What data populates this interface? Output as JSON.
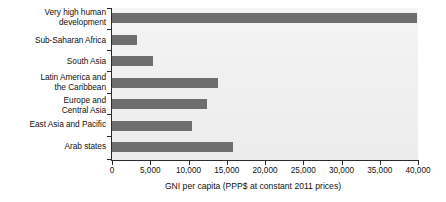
{
  "chart_data": {
    "type": "bar",
    "orientation": "horizontal",
    "title": "",
    "subtitle": "",
    "xlabel": "GNI per capita (PPP$ at constant 2011 prices)",
    "ylabel": "",
    "xlim": [
      0,
      40000
    ],
    "ylim": null,
    "grid": false,
    "legend": null,
    "legend_position": "none",
    "xticks": [
      0,
      5000,
      10000,
      15000,
      20000,
      25000,
      30000,
      35000,
      40000
    ],
    "xtick_labels": [
      "0",
      "5,000",
      "10,000",
      "15,000",
      "20,000",
      "25,000",
      "30,000",
      "35,000",
      "40,000"
    ],
    "categories": [
      "Very high human\ndevelopment",
      "Sub-Saharan Africa",
      "South Asia",
      "Latin America and\nthe Caribbean",
      "Europe and\nCentral Asia",
      "East Asia and Pacific",
      "Arab states"
    ],
    "values": [
      39900,
      3300,
      5300,
      13900,
      12400,
      10500,
      15800
    ],
    "bar_color": "#6e6e6e",
    "plot_background": "#f1f1f1",
    "axis_color": "#2b2b2b",
    "text_color": "#111111"
  }
}
